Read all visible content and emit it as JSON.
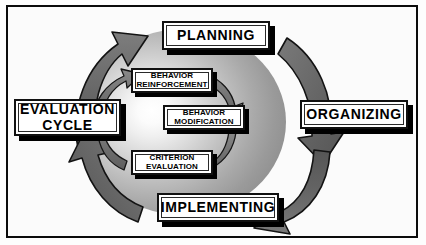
{
  "diagram": {
    "title_text": "",
    "background_color": "#fbfbfb",
    "frame_color": "#0b0b0b",
    "arrow_fill": "#6e6e6e",
    "arrow_stroke": "#111111",
    "ellipse_center_color": "#ffffff",
    "ellipse_edge_color": "#8b8b8b",
    "box_fill": "#ffffff",
    "box_border": "#111111",
    "shadow_color": "#000000",
    "outer_labels": [
      {
        "id": "planning",
        "label": "PLANNING",
        "position": "top"
      },
      {
        "id": "organizing",
        "label": "ORGANIZING",
        "position": "right"
      },
      {
        "id": "implementing",
        "label": "IMPLEMENTING",
        "position": "bottom"
      },
      {
        "id": "evaluation",
        "label": "EVALUATION\nCYCLE",
        "label_line1": "EVALUATION",
        "label_line2": "CYCLE",
        "position": "left"
      }
    ],
    "inner_labels": [
      {
        "id": "reinforcement",
        "label_line1": "BEHAVIOR",
        "label_line2": "REINFORCEMENT",
        "position": "upper-left"
      },
      {
        "id": "modification",
        "label_line1": "BEHAVIOR",
        "label_line2": "MODIFICATION",
        "position": "center"
      },
      {
        "id": "criterion",
        "label_line1": "CRITERION",
        "label_line2": "EVALUATION",
        "position": "lower-left"
      }
    ],
    "outer_arrow_count": 4,
    "inner_arrow_count": 4,
    "cycle_direction": "clockwise"
  }
}
